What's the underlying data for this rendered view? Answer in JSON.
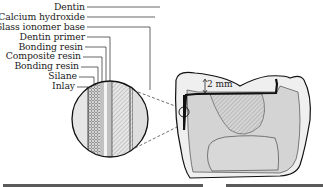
{
  "diagram": {
    "layer_labels": [
      {
        "label": "Dentin",
        "y": 7
      },
      {
        "label": "Calcium hydroxide",
        "y": 18
      },
      {
        "label": "Glass ionomer base",
        "y": 28
      },
      {
        "label": "Dentin primer",
        "y": 38
      },
      {
        "label": "Bonding resin",
        "y": 48
      },
      {
        "label": "Composite resin",
        "y": 57
      },
      {
        "label": "Bonding resin",
        "y": 67
      },
      {
        "label": "Silane",
        "y": 77
      },
      {
        "label": "Inlay",
        "y": 87
      }
    ],
    "dimension_label": "2 mm",
    "colors": {
      "line": "#1a1a1a",
      "dentin_fill": "#d6d6d6",
      "enamel_fill": "#efefef",
      "background": "#ffffff"
    }
  }
}
